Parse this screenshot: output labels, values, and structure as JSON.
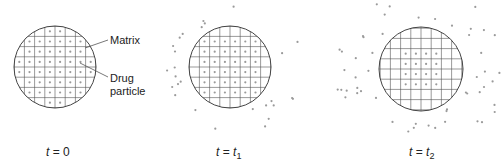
{
  "figure": {
    "panels": [
      {
        "id": "t0",
        "time_label": {
          "var": "t",
          "eq": " = ",
          "val": "0",
          "sub": ""
        },
        "inner_dot_rows": 7,
        "dots_inside": "full",
        "outside_dots": 0
      },
      {
        "id": "t1",
        "time_label": {
          "var": "t",
          "eq": " = ",
          "val": "t",
          "sub": "1"
        },
        "dots_inside": "partial",
        "outside_dots": 28
      },
      {
        "id": "t2",
        "time_label": {
          "var": "t",
          "eq": " = ",
          "val": "t",
          "sub": "2"
        },
        "dots_inside": "core-4x4",
        "outside_dots": 60
      }
    ],
    "annotations": {
      "matrix": "Matrix",
      "drug_line1": "Drug",
      "drug_line2": "particle"
    },
    "colors": {
      "line": "#555555",
      "dot": "#9a9a9a",
      "text": "#222222"
    }
  }
}
